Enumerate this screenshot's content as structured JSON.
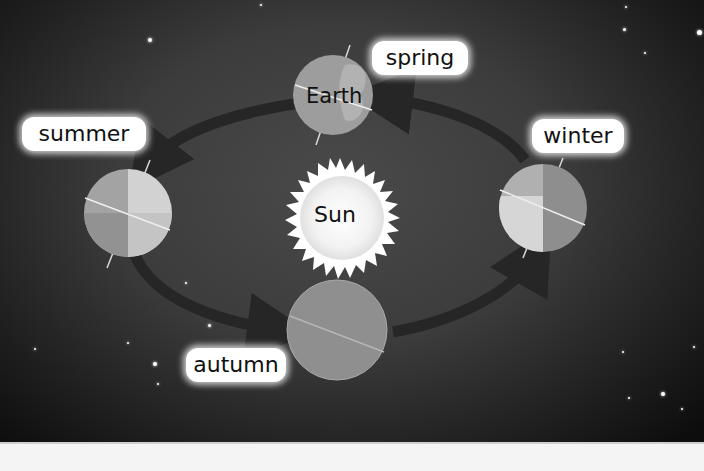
{
  "diagram": {
    "center": {
      "label": "Sun"
    },
    "planet_label": "Earth",
    "seasons": [
      {
        "id": "spring",
        "label": "spring",
        "position": "top"
      },
      {
        "id": "summer",
        "label": "summer",
        "position": "left"
      },
      {
        "id": "autumn",
        "label": "autumn",
        "position": "bottom"
      },
      {
        "id": "winter",
        "label": "winter",
        "position": "right"
      }
    ],
    "orbit_direction": "counterclockwise (spring → summer → autumn → winter → spring)",
    "colors": {
      "background": "#3c3c3c",
      "orbit_arrow": "#2a2a2a",
      "earth": "#9a9a9a",
      "sun": "#ffffff",
      "label_bg": "#ffffff"
    }
  }
}
